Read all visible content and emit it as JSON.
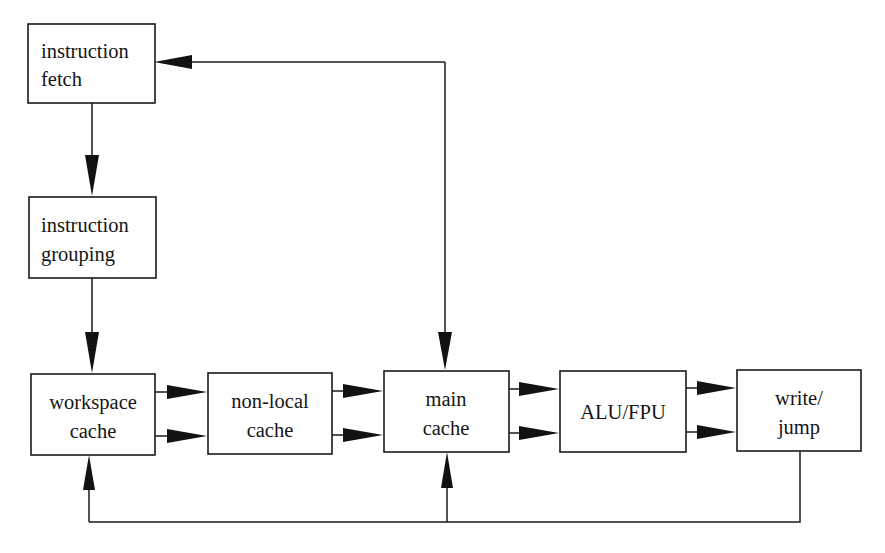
{
  "diagram": {
    "canvas": {
      "width": 885,
      "height": 553
    },
    "colors": {
      "background": "#ffffff",
      "stroke": "#1a1a1a",
      "text": "#151515",
      "box_fill": "#ffffff"
    },
    "nodes": [
      {
        "id": "instruction-fetch",
        "lines": [
          "instruction",
          "fetch"
        ],
        "line1": "instruction",
        "line2": "fetch",
        "x": 28,
        "y": 24,
        "w": 127,
        "h": 79,
        "align": "left"
      },
      {
        "id": "instruction-grouping",
        "lines": [
          "instruction",
          "grouping"
        ],
        "line1": "instruction",
        "line2": "grouping",
        "x": 29,
        "y": 197,
        "w": 127,
        "h": 81,
        "align": "left"
      },
      {
        "id": "workspace-cache",
        "lines": [
          "workspace",
          "cache"
        ],
        "line1": "workspace",
        "line2": "cache",
        "x": 31,
        "y": 374,
        "w": 124,
        "h": 81,
        "align": "center"
      },
      {
        "id": "non-local-cache",
        "lines": [
          "non-local",
          "cache"
        ],
        "line1": "non-local",
        "line2": "cache",
        "x": 208,
        "y": 373,
        "w": 124,
        "h": 81,
        "align": "center"
      },
      {
        "id": "main-cache",
        "lines": [
          "main",
          "cache"
        ],
        "line1": "main",
        "line2": "cache",
        "x": 384,
        "y": 371,
        "w": 125,
        "h": 81,
        "align": "center"
      },
      {
        "id": "alu-fpu",
        "lines": [
          "ALU/FPU"
        ],
        "line1": "ALU/FPU",
        "line2": "",
        "x": 560,
        "y": 371,
        "w": 126,
        "h": 81,
        "align": "center"
      },
      {
        "id": "write-jump",
        "lines": [
          "write/",
          "jump"
        ],
        "line1": "write/",
        "line2": "jump",
        "x": 737,
        "y": 370,
        "w": 124,
        "h": 81,
        "align": "center"
      }
    ],
    "edges": [
      {
        "id": "fetch-to-grouping",
        "from": "instruction-fetch",
        "to": "instruction-grouping",
        "label": "",
        "direction": "down"
      },
      {
        "id": "grouping-to-workspace",
        "from": "instruction-grouping",
        "to": "workspace-cache",
        "label": "",
        "direction": "down"
      },
      {
        "id": "workspace-to-nonlocal-upper",
        "from": "workspace-cache",
        "to": "non-local-cache",
        "label": "",
        "direction": "right"
      },
      {
        "id": "workspace-to-nonlocal-lower",
        "from": "workspace-cache",
        "to": "non-local-cache",
        "label": "",
        "direction": "right"
      },
      {
        "id": "nonlocal-to-main-upper",
        "from": "non-local-cache",
        "to": "main-cache",
        "label": "",
        "direction": "right"
      },
      {
        "id": "nonlocal-to-main-lower",
        "from": "non-local-cache",
        "to": "main-cache",
        "label": "",
        "direction": "right"
      },
      {
        "id": "main-to-alu-upper",
        "from": "main-cache",
        "to": "alu-fpu",
        "label": "",
        "direction": "right"
      },
      {
        "id": "main-to-alu-lower",
        "from": "main-cache",
        "to": "alu-fpu",
        "label": "",
        "direction": "right"
      },
      {
        "id": "alu-to-write-upper",
        "from": "alu-fpu",
        "to": "write-jump",
        "label": "",
        "direction": "right"
      },
      {
        "id": "alu-to-write-lower",
        "from": "alu-fpu",
        "to": "write-jump",
        "label": "",
        "direction": "right"
      },
      {
        "id": "branch-feedback-to-fetch",
        "from": "branch-junction",
        "to": "instruction-fetch",
        "label": "",
        "direction": "left"
      },
      {
        "id": "branch-feedback-to-main-cache",
        "from": "branch-junction",
        "to": "main-cache",
        "label": "",
        "direction": "down"
      },
      {
        "id": "writeback-to-workspace",
        "from": "write-jump",
        "to": "workspace-cache",
        "label": "",
        "direction": "up"
      },
      {
        "id": "writeback-to-main-cache",
        "from": "write-jump",
        "to": "main-cache",
        "label": "",
        "direction": "up"
      }
    ]
  }
}
